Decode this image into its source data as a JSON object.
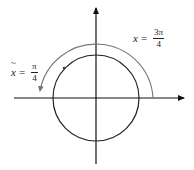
{
  "diagram": {
    "colors": {
      "axis": "#111111",
      "circle": "#222222",
      "arc": "#777777"
    },
    "labels": {
      "x_label": {
        "var": "x",
        "eq": "=",
        "num": "3π",
        "den": "4"
      },
      "xtilde_label": {
        "var": "x",
        "eq": "=",
        "num": "π",
        "den": "4"
      }
    }
  }
}
